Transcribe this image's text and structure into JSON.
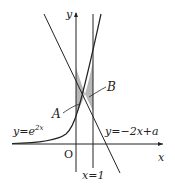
{
  "diagram": {
    "axes": {
      "x_label": "x",
      "y_label": "y",
      "origin_label": "O"
    },
    "curves": {
      "exp": {
        "label_base": "y=e",
        "label_exp": "2x"
      },
      "line": {
        "label": "y=−2x+a"
      },
      "vertical": {
        "label": "x=1"
      }
    },
    "regions": {
      "A": "A",
      "B": "B"
    },
    "colors": {
      "stroke": "#222222",
      "shade": "#b5b5b5"
    }
  }
}
